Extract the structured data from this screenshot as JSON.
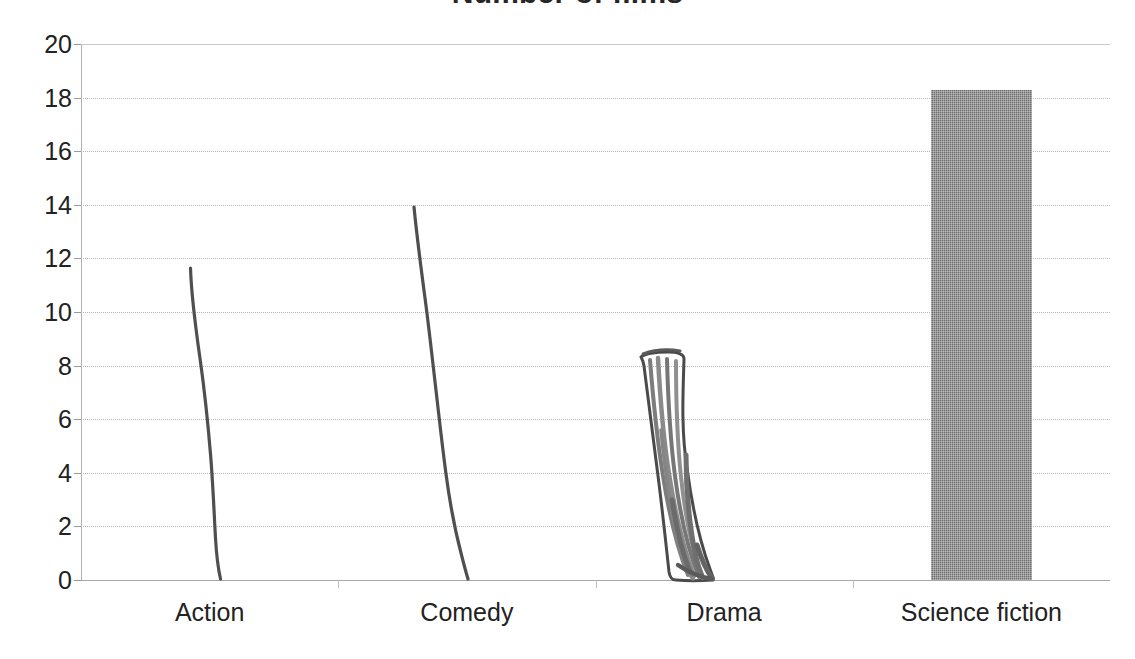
{
  "chart_data": {
    "type": "bar",
    "title": "Number of films",
    "xlabel": "",
    "ylabel": "",
    "categories": [
      "Action",
      "Comedy",
      "Drama",
      "Science fiction"
    ],
    "values": [
      11.8,
      14.0,
      8.3,
      18.3
    ],
    "series": [
      {
        "name": "Number of films",
        "values": [
          11.8,
          14.0,
          8.3,
          18.3
        ]
      }
    ],
    "ylim": [
      0,
      20
    ],
    "ytick_step": 2,
    "yticks": [
      20,
      18,
      16,
      14,
      12,
      10,
      8,
      6,
      4,
      2,
      0
    ],
    "ytick_labels": [
      "20",
      "18",
      "16",
      "14",
      "12",
      "10",
      "8",
      "6",
      "4",
      "2",
      "0"
    ],
    "grid": true,
    "grid_axis": "y",
    "legend": false,
    "legend_position": "none",
    "annotations": [
      "Action, Comedy and Drama are hand-drawn pen marks over the printed grid",
      "Only the Science fiction bar is a printed solid grey bar",
      "Chart title is clipped by the top edge of the screenshot"
    ],
    "bar_style": {
      "science_fiction_fill": "#6e6e6e",
      "hand_drawn_ink": "#4a4a4a"
    }
  },
  "axes": {
    "y_axis_name": "y-axis",
    "x_axis_name": "x-axis",
    "grid_color": "#b7b7b7",
    "axis_color": "#a6a6a6"
  }
}
